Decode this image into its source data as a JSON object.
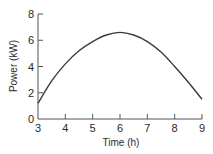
{
  "chart_data": {
    "type": "line",
    "title": "",
    "xlabel": "Time (h)",
    "ylabel": "Power (kW)",
    "xlim": [
      3,
      9
    ],
    "ylim": [
      0,
      8
    ],
    "x_ticks": [
      3,
      4,
      5,
      6,
      7,
      8,
      9
    ],
    "y_ticks": [
      0,
      2,
      4,
      6,
      8
    ],
    "grid": false,
    "legend": null,
    "series": [
      {
        "name": "Power",
        "x": [
          3,
          3.5,
          4,
          4.5,
          5,
          5.5,
          6,
          6.5,
          7,
          7.5,
          8,
          8.5,
          9
        ],
        "values": [
          1.2,
          2.9,
          4.2,
          5.2,
          5.9,
          6.4,
          6.6,
          6.4,
          5.9,
          5.1,
          4.0,
          2.8,
          1.5
        ]
      }
    ]
  },
  "colors": {
    "line": "#3a3a3a",
    "axis": "#555555",
    "background": "#ffffff"
  }
}
